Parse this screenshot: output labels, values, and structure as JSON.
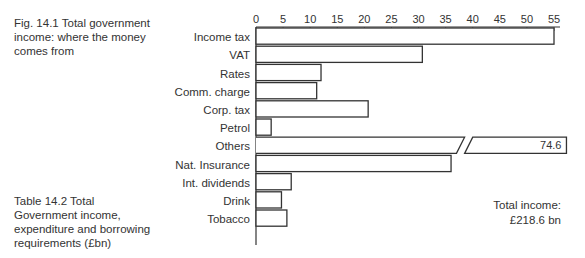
{
  "figure_caption": "Fig. 14.1  Total government income: where the money comes from",
  "figure_caption_lines": [
    "Fig. 14.1  Total government",
    "income: where the money",
    "comes from"
  ],
  "table_caption_lines": [
    "Table 14.2  Total",
    "Government income,",
    "expenditure and borrowing",
    "requirements (£bn)"
  ],
  "total_lines": [
    "Total income:",
    "£218.6 bn"
  ],
  "chart_data": {
    "type": "bar",
    "orientation": "horizontal",
    "title": "Total government income: where the money comes from",
    "xlabel": "",
    "ylabel": "",
    "units": "£bn",
    "xlim": [
      0,
      55
    ],
    "ticks": [
      0,
      5,
      10,
      15,
      20,
      25,
      30,
      35,
      40,
      45,
      50,
      55
    ],
    "grid": false,
    "categories": [
      "Income tax",
      "VAT",
      "Rates",
      "Comm. charge",
      "Corp. tax",
      "Petrol",
      "Others",
      "Nat. Insurance",
      "Int. dividends",
      "Drink",
      "Tobacco"
    ],
    "values": [
      55,
      30.7,
      12,
      11.2,
      20.7,
      2.8,
      74.6,
      36,
      6.5,
      4.7,
      5.7
    ],
    "annotations": [
      {
        "category": "Others",
        "label": "74.6",
        "note": "bar broken (exceeds axis)"
      },
      {
        "text": "Total income: £218.6 bn"
      }
    ]
  }
}
